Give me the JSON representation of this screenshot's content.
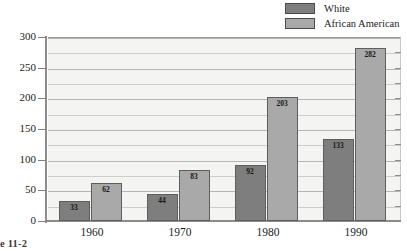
{
  "chart_data": {
    "type": "bar",
    "title": "",
    "xlabel": "",
    "ylabel": "",
    "categories": [
      "1960",
      "1970",
      "1980",
      "1990"
    ],
    "series": [
      {
        "name": "White",
        "values": [
          33,
          44,
          92,
          133
        ],
        "color": "#7e7e7e"
      },
      {
        "name": "African American",
        "values": [
          62,
          83,
          203,
          282
        ],
        "color": "#a9a9a9"
      }
    ],
    "ylim": [
      0,
      300
    ],
    "y_ticks": [
      0,
      50,
      100,
      150,
      200,
      250,
      300
    ],
    "y_minor_ticks": [
      25,
      75,
      125,
      175,
      225,
      275
    ],
    "grid": true,
    "legend_position": "top-right"
  },
  "legend": {
    "items": [
      {
        "label": "White",
        "color": "#7e7e7e"
      },
      {
        "label": "African American",
        "color": "#a9a9a9"
      }
    ]
  },
  "axis": {
    "y_tick_labels": [
      "300",
      "250",
      "200",
      "150",
      "100",
      "50",
      "0"
    ],
    "x_tick_labels": [
      "1960",
      "1970",
      "1980",
      "1990"
    ]
  },
  "bar_labels": {
    "g0": {
      "white": "33",
      "aa": "62"
    },
    "g1": {
      "white": "44",
      "aa": "83"
    },
    "g2": {
      "white": "92",
      "aa": "203"
    },
    "g3": {
      "white": "133",
      "aa": "282"
    }
  },
  "caption": {
    "text": "e 11-2"
  }
}
